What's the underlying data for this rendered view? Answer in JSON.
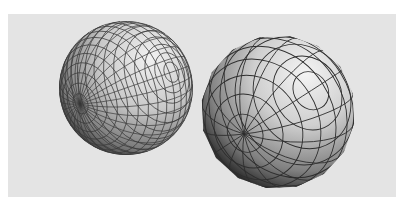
{
  "figure": {
    "background_color": "#e4e4e4",
    "spheres": [
      {
        "name": "high-poly-sphere",
        "cx": 126,
        "cy": 88,
        "r": 67,
        "pole": [
          80,
          104
        ],
        "rings": 10,
        "segments": 32,
        "light": "#f2f2f2",
        "dark": "#2a2a2a"
      },
      {
        "name": "low-poly-sphere",
        "cx": 278,
        "cy": 112,
        "r": 77,
        "pole": [
          244,
          134
        ],
        "rings": 6,
        "segments": 16,
        "light": "#f4f4f4",
        "dark": "#161616"
      }
    ]
  }
}
